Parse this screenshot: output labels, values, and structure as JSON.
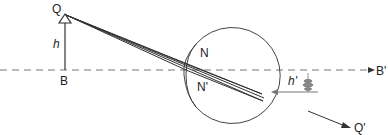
{
  "diagram": {
    "type": "eye-image-formation",
    "labels": {
      "object_top": "Q",
      "object_height": "h",
      "object_base": "B",
      "nodal_point_1": "N",
      "nodal_point_2": "N'",
      "image_height": "h'",
      "axis_end": "B'",
      "image_direction": "Q'"
    },
    "colors": {
      "line": "#333333",
      "axis": "#777777",
      "background": "#ffffff"
    }
  }
}
